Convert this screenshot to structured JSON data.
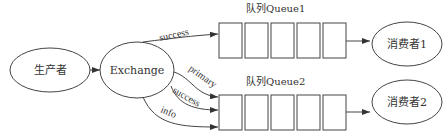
{
  "nodes": {
    "producer": "生产者",
    "exchange": "Exchange",
    "consumer1": "消费者1",
    "consumer2": "消费者2"
  },
  "queues": {
    "queue1": {
      "title": "队列Queue1",
      "slots": 5
    },
    "queue2": {
      "title": "队列Queue2",
      "slots": 5
    }
  },
  "edges": {
    "to_queue1": "success",
    "primary": "primary",
    "success": "success",
    "info": "info"
  }
}
